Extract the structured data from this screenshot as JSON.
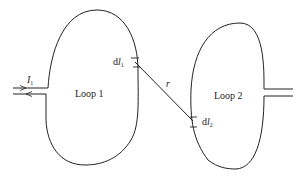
{
  "diagram": {
    "loop1": {
      "label": "Loop 1",
      "current_symbol": "I",
      "current_subscript": "1"
    },
    "loop2": {
      "label": "Loop 2"
    },
    "element1": {
      "prefix": "d",
      "symbol": "l",
      "subscript": "1"
    },
    "element2": {
      "prefix": "d",
      "symbol": "l",
      "subscript": "2"
    },
    "separation": {
      "label": "r"
    },
    "colors": {
      "stroke": "#222222",
      "background": "#ffffff"
    }
  }
}
